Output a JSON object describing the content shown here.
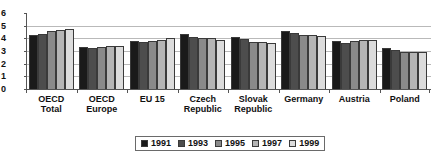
{
  "chart_data": {
    "type": "bar",
    "title": "",
    "xlabel": "",
    "ylabel": "",
    "ylim": [
      0,
      6
    ],
    "yticks": [
      0,
      1,
      2,
      3,
      4,
      5,
      6
    ],
    "grid": true,
    "legend_position": "bottom",
    "categories": [
      "OECD\nTotal",
      "OECD\nEurope",
      "EU 15",
      "Czech\nRepublic",
      "Slovak\nRepublic",
      "Germany",
      "Austria",
      "Poland"
    ],
    "series": [
      {
        "name": "1991",
        "color": "#1a1a1a",
        "values": [
          4.3,
          3.3,
          3.8,
          4.35,
          4.1,
          4.6,
          3.8,
          3.2
        ]
      },
      {
        "name": "1993",
        "color": "#4d4d4d",
        "values": [
          4.35,
          3.25,
          3.75,
          4.1,
          3.95,
          4.4,
          3.65,
          3.1
        ]
      },
      {
        "name": "1995",
        "color": "#8a8a8a",
        "values": [
          4.55,
          3.3,
          3.8,
          4.05,
          3.75,
          4.3,
          3.8,
          2.95
        ]
      },
      {
        "name": "1997",
        "color": "#b5b5b5",
        "values": [
          4.65,
          3.4,
          3.85,
          4.0,
          3.7,
          4.3,
          3.85,
          2.95
        ]
      },
      {
        "name": "1999",
        "color": "#dcdcdc",
        "values": [
          4.7,
          3.4,
          4.0,
          3.9,
          3.6,
          4.2,
          3.9,
          2.9
        ]
      }
    ]
  },
  "legend": {
    "items": [
      {
        "label": "1991"
      },
      {
        "label": "1993"
      },
      {
        "label": "1995"
      },
      {
        "label": "1997"
      },
      {
        "label": "1999"
      }
    ]
  },
  "axis": {
    "y_labels": [
      "6",
      "5",
      "4",
      "3",
      "2",
      "1",
      "0"
    ]
  }
}
